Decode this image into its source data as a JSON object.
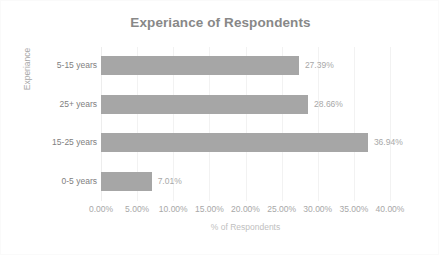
{
  "chart_data": {
    "type": "bar",
    "orientation": "horizontal",
    "title": "Experiance of Respondents",
    "xlabel": "% of Respondents",
    "ylabel": "Experiance",
    "categories": [
      "5-15 years",
      "25+ years",
      "15-25 years",
      "0-5 years"
    ],
    "values": [
      27.39,
      28.66,
      36.94,
      7.01
    ],
    "value_labels": [
      "27.39%",
      "28.66%",
      "36.94%",
      "7.01%"
    ],
    "xlim": [
      0,
      40
    ],
    "xticks": [
      0,
      5,
      10,
      15,
      20,
      25,
      30,
      35,
      40
    ],
    "xtick_labels": [
      "0.00%",
      "5.00%",
      "10.00%",
      "15.00%",
      "20.00%",
      "25.00%",
      "30.00%",
      "35.00%",
      "40.00%"
    ],
    "grid": "vertical",
    "legend": null,
    "series_color": "#a6a6a6",
    "title_color": "#888888",
    "label_color": "#a8a8a8",
    "category_label_color": "#808080",
    "gridline_color": "#f2f2f2",
    "background": "#ffffff"
  }
}
